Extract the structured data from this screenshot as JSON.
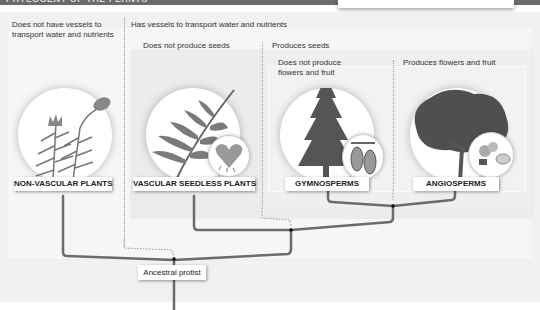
{
  "header": {
    "title": "PHYLOGENY OF THE PLANTS",
    "bar_color": "#6a6a6a"
  },
  "panels": {
    "non_vascular": "Does not have vessels to transport water and nutrients",
    "vascular": "Has vessels to transport water and nutrients",
    "seedless": "Does not produce seeds",
    "seeds": "Produces seeds",
    "no_flowers": "Does not produce flowers and fruit",
    "flowers": "Produces flowers and fruit"
  },
  "groups": [
    {
      "id": "non-vascular",
      "label": "NON-VASCULAR PLANTS",
      "illustration": "moss-icon"
    },
    {
      "id": "vascular-seedless",
      "label": "VASCULAR SEEDLESS PLANTS",
      "illustration": "fern-icon",
      "inset": "gametophyte-heart-icon"
    },
    {
      "id": "gymnosperms",
      "label": "GYMNOSPERMS",
      "illustration": "conifer-tree-icon",
      "inset": "pine-cone-icon"
    },
    {
      "id": "angiosperms",
      "label": "ANGIOSPERMS",
      "illustration": "deciduous-tree-icon",
      "inset": "flower-fruit-icon"
    }
  ],
  "root": {
    "label": "Ancestral protist"
  },
  "colors": {
    "branch": "#6b6b6b",
    "node": "#111111",
    "dotted": "#999999"
  }
}
